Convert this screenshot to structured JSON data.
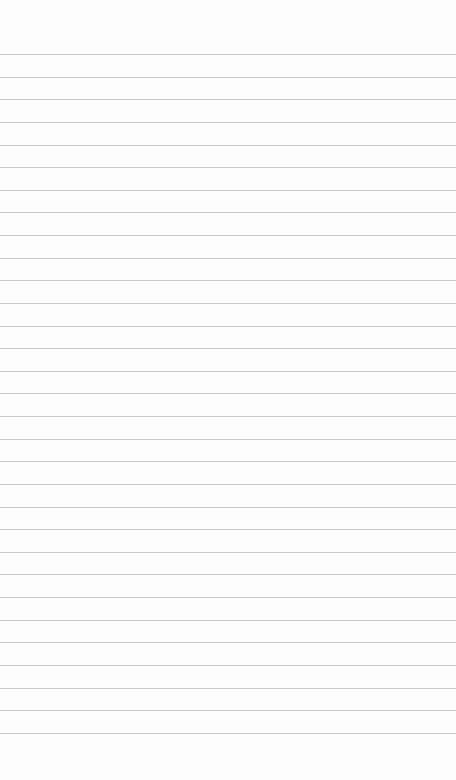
{
  "page": {
    "type": "blank ruled paper",
    "background_color": "#fdfdfd",
    "line_color": "#c9c9c9",
    "line_count": 31,
    "first_line_y": 54,
    "line_spacing": 22.63,
    "text": ""
  }
}
